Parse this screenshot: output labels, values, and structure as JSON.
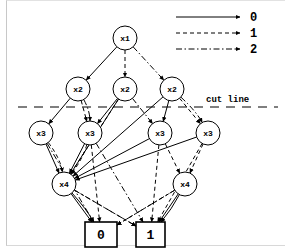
{
  "figure": {
    "cut_line_label": "cut line"
  },
  "legend": {
    "entries": [
      {
        "label": "0",
        "style": "solid",
        "name": "legend-edge-0"
      },
      {
        "label": "1",
        "style": "dashed",
        "name": "legend-edge-1"
      },
      {
        "label": "2",
        "style": "dashdot",
        "name": "legend-edge-2"
      }
    ]
  },
  "nodes": [
    {
      "id": "n1",
      "label": "x1",
      "level": 1,
      "cx": 125,
      "cy": 38,
      "r": 12
    },
    {
      "id": "n2a",
      "label": "x2",
      "level": 2,
      "cx": 78,
      "cy": 89,
      "r": 12
    },
    {
      "id": "n2b",
      "label": "x2",
      "level": 2,
      "cx": 125,
      "cy": 89,
      "r": 12
    },
    {
      "id": "n2c",
      "label": "x2",
      "level": 2,
      "cx": 172,
      "cy": 89,
      "r": 12
    },
    {
      "id": "n3a",
      "label": "x3",
      "level": 3,
      "cx": 41,
      "cy": 133,
      "r": 12
    },
    {
      "id": "n3b",
      "label": "x3",
      "level": 3,
      "cx": 90,
      "cy": 133,
      "r": 12
    },
    {
      "id": "n3c",
      "label": "x3",
      "level": 3,
      "cx": 160,
      "cy": 133,
      "r": 12
    },
    {
      "id": "n3d",
      "label": "x3",
      "level": 3,
      "cx": 208,
      "cy": 133,
      "r": 12
    },
    {
      "id": "n4a",
      "label": "x4",
      "level": 4,
      "cx": 64,
      "cy": 184,
      "r": 12
    },
    {
      "id": "n4b",
      "label": "x4",
      "level": 4,
      "cx": 185,
      "cy": 184,
      "r": 12
    }
  ],
  "terminals": [
    {
      "id": "t0",
      "label": "0",
      "x": 85,
      "y": 222,
      "w": 32,
      "h": 25
    },
    {
      "id": "t1",
      "label": "1",
      "x": 136,
      "y": 222,
      "w": 29,
      "h": 25
    }
  ],
  "cut_line": {
    "y": 107,
    "x_start": 18,
    "x_end": 278,
    "label_x": 206,
    "label_y": 100
  },
  "edges": [
    {
      "from": "n1",
      "to": "n2a",
      "value": 0
    },
    {
      "from": "n1",
      "to": "n2b",
      "value": 1
    },
    {
      "from": "n1",
      "to": "n2c",
      "value": 2
    },
    {
      "from": "n2a",
      "to": "n3a",
      "value": 0
    },
    {
      "from": "n2a",
      "to": "n3b",
      "value": 1
    },
    {
      "from": "n2a",
      "to": "n3b",
      "value": 2,
      "bow": 6
    },
    {
      "from": "n2b",
      "to": "n3b",
      "value": 0
    },
    {
      "from": "n2b",
      "to": "n4a",
      "value": 0,
      "bow": 0
    },
    {
      "from": "n2b",
      "to": "n4a",
      "value": 1
    },
    {
      "from": "n2b",
      "to": "n3c",
      "value": 2
    },
    {
      "from": "n2c",
      "to": "n3c",
      "value": 0
    },
    {
      "from": "n2c",
      "to": "n4a",
      "value": 0,
      "bow": 0
    },
    {
      "from": "n2c",
      "to": "n3d",
      "value": 1
    },
    {
      "from": "n2c",
      "to": "n3d",
      "value": 2,
      "bow": 6
    },
    {
      "from": "n3a",
      "to": "n4a",
      "value": 0
    },
    {
      "from": "n3a",
      "to": "n4a",
      "value": 1,
      "bow": 8
    },
    {
      "from": "n3a",
      "to": "t0",
      "value": 2
    },
    {
      "from": "n3b",
      "to": "n4a",
      "value": 0
    },
    {
      "from": "n3b",
      "to": "n4a",
      "value": 1,
      "bow": 6
    },
    {
      "from": "n3b",
      "to": "t0",
      "value": 1
    },
    {
      "from": "n3b",
      "to": "t1",
      "value": 2
    },
    {
      "from": "n3c",
      "to": "n4a",
      "value": 0
    },
    {
      "from": "n3c",
      "to": "n4b",
      "value": 1
    },
    {
      "from": "n3c",
      "to": "t1",
      "value": 1
    },
    {
      "from": "n3d",
      "to": "n4b",
      "value": 1
    },
    {
      "from": "n3d",
      "to": "n4a",
      "value": 0
    },
    {
      "from": "n3d",
      "to": "t1",
      "value": 1,
      "bow": 0
    },
    {
      "from": "n4a",
      "to": "t0",
      "value": 0
    },
    {
      "from": "n4a",
      "to": "t0",
      "value": 0,
      "bow": 4
    },
    {
      "from": "n4a",
      "to": "t1",
      "value": 1
    },
    {
      "from": "n4a",
      "to": "t1",
      "value": 2
    },
    {
      "from": "n4b",
      "to": "t0",
      "value": 1
    },
    {
      "from": "n4b",
      "to": "t0",
      "value": 2
    },
    {
      "from": "n4b",
      "to": "t1",
      "value": 0
    },
    {
      "from": "n4b",
      "to": "t1",
      "value": 0,
      "bow": 4
    }
  ],
  "styles": {
    "edge_color": "#000000",
    "node_fill": "#ffffff",
    "node_stroke": "#000000",
    "background": "#ffffff",
    "frame_color": "#c8c8c8"
  }
}
